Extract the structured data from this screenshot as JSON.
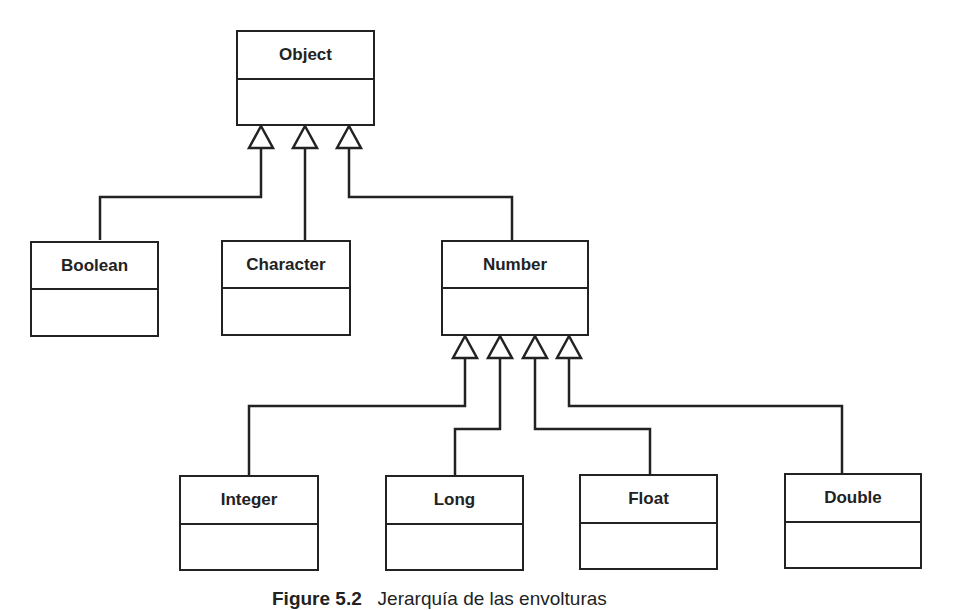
{
  "diagram": {
    "type": "uml-class-hierarchy",
    "classes": [
      {
        "id": "object",
        "name": "Object"
      },
      {
        "id": "boolean",
        "name": "Boolean",
        "parent": "Object"
      },
      {
        "id": "character",
        "name": "Character",
        "parent": "Object"
      },
      {
        "id": "number",
        "name": "Number",
        "parent": "Object"
      },
      {
        "id": "integer",
        "name": "Integer",
        "parent": "Number"
      },
      {
        "id": "long",
        "name": "Long",
        "parent": "Number"
      },
      {
        "id": "float",
        "name": "Float",
        "parent": "Number"
      },
      {
        "id": "double",
        "name": "Double",
        "parent": "Number"
      }
    ],
    "relation": "generalization (hollow triangle arrow)"
  },
  "caption": {
    "label": "Figure 5.2",
    "text": "Jerarquía de las envolturas"
  },
  "colors": {
    "stroke": "#222222",
    "background": "#ffffff"
  }
}
